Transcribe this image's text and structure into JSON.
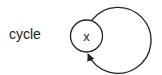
{
  "diagram": {
    "caption": "cycle",
    "node": {
      "label": "x"
    },
    "edge": {
      "type": "self-loop",
      "from": "x",
      "to": "x"
    },
    "colors": {
      "stroke": "#222222",
      "background": "#ffffff"
    }
  }
}
